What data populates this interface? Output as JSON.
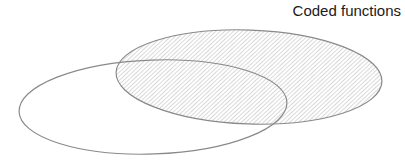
{
  "diagram": {
    "type": "venn",
    "sets": [
      {
        "id": "coded-functions",
        "label": "Coded functions",
        "fill": "hatched",
        "hatch_color": "#b4b4b4",
        "stroke": "#8a8a8a",
        "cx": 249,
        "cy": 77,
        "rx": 133,
        "ry": 47
      },
      {
        "id": "unlabeled-set",
        "label": "",
        "fill": "none",
        "stroke": "#8a8a8a",
        "cx": 153,
        "cy": 107,
        "rx": 134,
        "ry": 47
      }
    ]
  }
}
